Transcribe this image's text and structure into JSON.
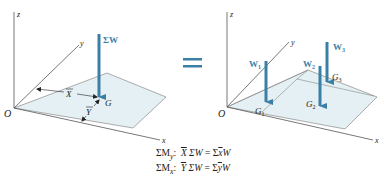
{
  "colors": {
    "arrow": "#3a80a6",
    "plate_fill": "#e4f0f3",
    "line": "#555555",
    "equals": "#3a80a6"
  },
  "left_diagram": {
    "axes": {
      "x": "x",
      "y": "y",
      "z": "z",
      "origin": "O"
    },
    "force_label": "ΣW",
    "centroid_label": "G",
    "xbar_label": "X",
    "ybar_label": "Y"
  },
  "equals_sign": "=",
  "right_diagram": {
    "axes": {
      "x": "x",
      "y": "y",
      "z": "z",
      "origin": "O"
    },
    "forces": [
      {
        "label": "W",
        "sub": "1",
        "point": "G",
        "point_sub": "1"
      },
      {
        "label": "W",
        "sub": "2",
        "point": "G",
        "point_sub": "2"
      },
      {
        "label": "W",
        "sub": "3",
        "point": "G",
        "point_sub": "3"
      }
    ]
  },
  "equations": [
    {
      "moment": "ΣM",
      "axis": "y",
      "lhs_bar": "X",
      "lhs_rest": "ΣW",
      "rhs_sum": "Σ",
      "rhs_bar": "x",
      "rhs_rest": "W"
    },
    {
      "moment": "ΣM",
      "axis": "x",
      "lhs_bar": "Y",
      "lhs_rest": "ΣW",
      "rhs_sum": "Σ",
      "rhs_bar": "y",
      "rhs_rest": "W"
    }
  ]
}
